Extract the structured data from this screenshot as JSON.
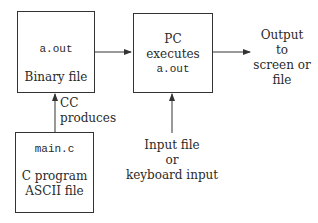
{
  "nodes": {
    "binary": {
      "code": "a.out",
      "label": "Binary file"
    },
    "pc": {
      "line1": "PC",
      "line2": "executes",
      "code": "a.out"
    },
    "source": {
      "code": "main.c",
      "label1": "C program",
      "label2": "ASCII file"
    }
  },
  "labels": {
    "cc_line1": "CC",
    "cc_line2": "produces",
    "output_line1": "Output",
    "output_line2": "to",
    "output_line3": "screen or",
    "output_line4": "file",
    "input_line1": "Input file",
    "input_line2": "or",
    "input_line3": "keyboard input"
  }
}
